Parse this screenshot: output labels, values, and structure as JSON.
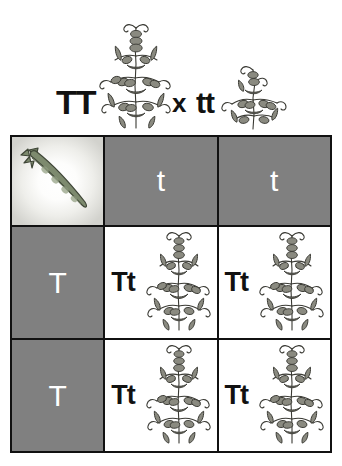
{
  "cross": {
    "parent_a_genotype": "TT",
    "cross_symbol": "x",
    "parent_b_genotype": "tt",
    "parent_a_icon": "tall-pea-plant-icon",
    "parent_b_icon": "short-pea-plant-icon"
  },
  "punnett": {
    "corner_icon": "pea-pod-icon",
    "column_headers": [
      "t",
      "t"
    ],
    "row_headers": [
      "T",
      "T"
    ],
    "cells": [
      [
        {
          "genotype": "Tt",
          "icon": "tall-pea-plant-icon"
        },
        {
          "genotype": "Tt",
          "icon": "tall-pea-plant-icon"
        }
      ],
      [
        {
          "genotype": "Tt",
          "icon": "tall-pea-plant-icon"
        },
        {
          "genotype": "Tt",
          "icon": "tall-pea-plant-icon"
        }
      ]
    ]
  },
  "colors": {
    "header_cell_gray": "#808080",
    "header_text": "#ffffff",
    "grid_border": "#111111",
    "cell_background": "#ffffff",
    "page_background": "#ffffff",
    "plant_fill": "#8a8a80",
    "pod_fill": "#7d8a6e"
  }
}
